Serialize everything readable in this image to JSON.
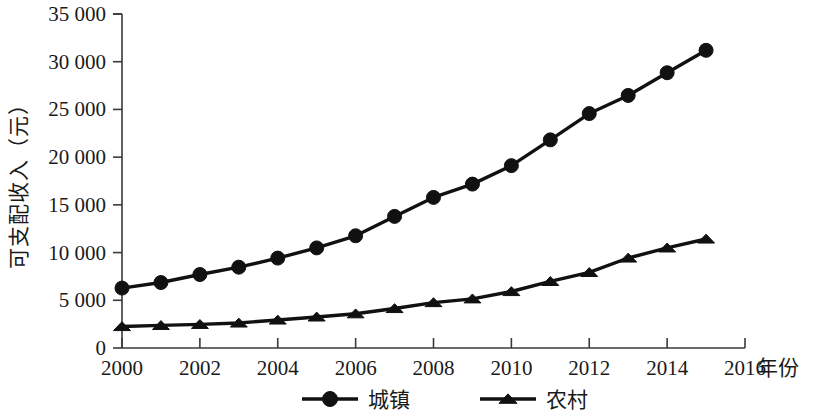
{
  "chart_data": {
    "type": "line",
    "title": "",
    "xlabel": "年份",
    "ylabel": "可支配收入（元）",
    "x": [
      2000,
      2001,
      2002,
      2003,
      2004,
      2005,
      2006,
      2007,
      2008,
      2009,
      2010,
      2011,
      2012,
      2013,
      2014,
      2015
    ],
    "xlim": [
      2000,
      2016
    ],
    "ylim": [
      0,
      35000
    ],
    "x_ticks": [
      2000,
      2002,
      2004,
      2006,
      2008,
      2010,
      2012,
      2014,
      2016
    ],
    "x_tick_labels": [
      "2000",
      "2002",
      "2004",
      "2006",
      "2008",
      "2010",
      "2012",
      "2014",
      "2016"
    ],
    "y_ticks": [
      0,
      5000,
      10000,
      15000,
      20000,
      25000,
      30000,
      35000
    ],
    "y_tick_labels": [
      "0",
      "5 000",
      "10 000",
      "15 000",
      "20 000",
      "25 000",
      "30 000",
      "35 000"
    ],
    "grid": false,
    "legend_position": "bottom",
    "series": [
      {
        "name": "城镇",
        "marker": "circle",
        "color": "#111111",
        "values": [
          6280,
          6860,
          7700,
          8470,
          9420,
          10490,
          11760,
          13790,
          15780,
          17175,
          19110,
          21810,
          24565,
          26467,
          28844,
          31195
        ]
      },
      {
        "name": "农村",
        "marker": "triangle",
        "color": "#111111",
        "values": [
          2253,
          2366,
          2476,
          2622,
          2936,
          3255,
          3587,
          4140,
          4761,
          5153,
          5919,
          6977,
          7917,
          9430,
          10489,
          11422
        ]
      }
    ]
  },
  "axis": {
    "y_title": "可支配收入（元）",
    "x_title": "年份"
  },
  "legend": {
    "items": [
      {
        "label": "城镇",
        "marker": "circle"
      },
      {
        "label": "农村",
        "marker": "triangle"
      }
    ]
  }
}
